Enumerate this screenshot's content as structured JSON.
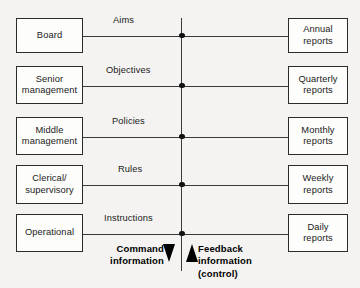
{
  "diagram": {
    "spine": {
      "color": "#3a3a3a"
    },
    "rows": [
      {
        "left_label": "Board",
        "left_lines": [
          "Board"
        ],
        "edge_label": "Aims",
        "right_label": "Annual reports",
        "right_lines": [
          "Annual",
          "reports"
        ],
        "box_top": 18,
        "box_height": 35,
        "line_y": 35.5,
        "edge_label_x": 113,
        "edge_label_y": 15
      },
      {
        "left_label": "Senior management",
        "left_lines": [
          "Senior",
          "management"
        ],
        "edge_label": "Objectives",
        "right_label": "Quarterly reports",
        "right_lines": [
          "Quarterly",
          "reports"
        ],
        "box_top": 66,
        "box_height": 38,
        "line_y": 85.5,
        "edge_label_x": 106,
        "edge_label_y": 65
      },
      {
        "left_label": "Middle management",
        "left_lines": [
          "Middle",
          "management"
        ],
        "edge_label": "Policies",
        "right_label": "Monthly reports",
        "right_lines": [
          "Monthly",
          "reports"
        ],
        "box_top": 117,
        "box_height": 38,
        "line_y": 136.5,
        "edge_label_x": 112,
        "edge_label_y": 116
      },
      {
        "left_label": "Clerical/ supervisory",
        "left_lines": [
          "Clerical/",
          "supervisory"
        ],
        "edge_label": "Rules",
        "right_label": "Weekly reports",
        "right_lines": [
          "Weekly",
          "reports"
        ],
        "box_top": 165,
        "box_height": 39,
        "line_y": 184.5,
        "edge_label_x": 118,
        "edge_label_y": 164
      },
      {
        "left_label": "Operational",
        "left_lines": [
          "Operational"
        ],
        "edge_label": "Instructions",
        "right_label": "Daily reports",
        "right_lines": [
          "Daily",
          "reports"
        ],
        "box_top": 214,
        "box_height": 38,
        "line_y": 233.5,
        "edge_label_x": 104,
        "edge_label_y": 213
      }
    ],
    "legend": {
      "command": {
        "lines": [
          "Command",
          "information"
        ],
        "arrow": "arrow-down-icon"
      },
      "feedback": {
        "lines": [
          "Feedback",
          "information",
          "(control)"
        ],
        "arrow": "arrow-up-icon"
      }
    }
  }
}
